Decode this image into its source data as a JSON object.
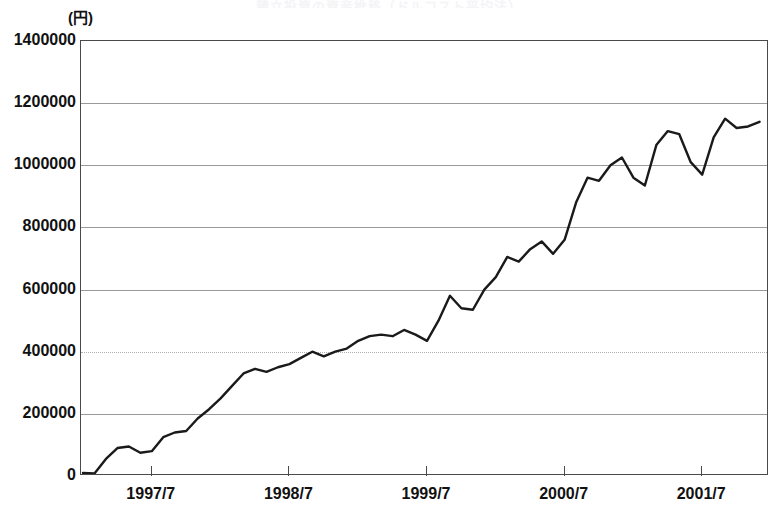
{
  "chart_data": {
    "type": "line",
    "title": "積立投資の資産推移（ドルコスト平均法）",
    "subtitle": "",
    "xlabel": "",
    "ylabel": "(円)",
    "yunit_label": "(円)",
    "ylim": [
      0,
      1400000
    ],
    "xlim": [
      "1997/1",
      "2001/12"
    ],
    "grid": true,
    "grid_axis": "y",
    "legend": "none",
    "y_ticks": [
      0,
      200000,
      400000,
      600000,
      800000,
      1000000,
      1200000,
      1400000
    ],
    "y_tick_labels": [
      "0",
      "200000",
      "400000",
      "600000",
      "800000",
      "1000000",
      "1200000",
      "1400000"
    ],
    "x_ticks": [
      "1997/7",
      "1998/7",
      "1999/7",
      "2000/7",
      "2001/7"
    ],
    "x_tick_labels": [
      "1997/7",
      "1998/7",
      "1999/7",
      "2000/7",
      "2001/7"
    ],
    "line_color": "#1a1a1a",
    "line_width": 2.4,
    "series": [
      {
        "name": "資産評価額",
        "x": [
          "1997/1",
          "1997/2",
          "1997/3",
          "1997/4",
          "1997/5",
          "1997/6",
          "1997/7",
          "1997/8",
          "1997/9",
          "1997/10",
          "1997/11",
          "1997/12",
          "1998/1",
          "1998/2",
          "1998/3",
          "1998/4",
          "1998/5",
          "1998/6",
          "1998/7",
          "1998/8",
          "1998/9",
          "1998/10",
          "1998/11",
          "1998/12",
          "1999/1",
          "1999/2",
          "1999/3",
          "1999/4",
          "1999/5",
          "1999/6",
          "1999/7",
          "1999/8",
          "1999/9",
          "1999/10",
          "1999/11",
          "1999/12",
          "2000/1",
          "2000/2",
          "2000/3",
          "2000/4",
          "2000/5",
          "2000/6",
          "2000/7",
          "2000/8",
          "2000/9",
          "2000/10",
          "2000/11",
          "2000/12",
          "2001/1",
          "2001/2",
          "2001/3",
          "2001/4",
          "2001/5",
          "2001/6",
          "2001/7",
          "2001/8",
          "2001/9",
          "2001/10",
          "2001/11",
          "2001/12"
        ],
        "values": [
          10000,
          8000,
          55000,
          90000,
          95000,
          75000,
          80000,
          125000,
          140000,
          145000,
          185000,
          215000,
          250000,
          290000,
          330000,
          345000,
          335000,
          350000,
          360000,
          380000,
          400000,
          385000,
          400000,
          410000,
          435000,
          450000,
          455000,
          450000,
          470000,
          455000,
          435000,
          500000,
          580000,
          540000,
          535000,
          600000,
          640000,
          705000,
          690000,
          730000,
          755000,
          715000,
          760000,
          880000,
          960000,
          950000,
          1000000,
          1025000,
          960000,
          935000,
          1065000,
          1110000,
          1100000,
          1010000,
          970000,
          1090000,
          1150000,
          1120000,
          1125000,
          1140000
        ]
      }
    ],
    "notes": {
      "start_value_near_zero": "series begins just above 0 at the left axis",
      "end_value": 1040000,
      "peak_value": 1150000,
      "peak_x": "2001/9"
    }
  },
  "axis": {
    "y_unit": "(円)",
    "zero_label": "0"
  }
}
